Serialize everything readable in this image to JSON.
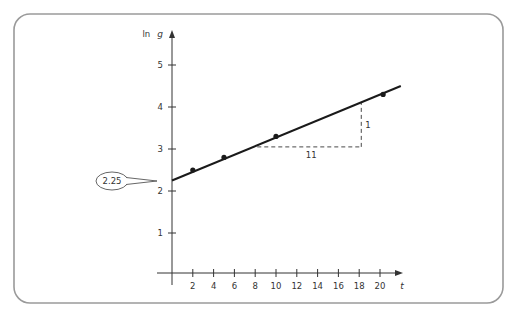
{
  "frame": {
    "stroke": "#9a9a9a",
    "background": "#ffffff"
  },
  "chart_data": {
    "type": "scatter",
    "title": "",
    "xlabel": "t",
    "ylabel": "ln g",
    "ylabel_prefix": "ln",
    "ylabel_var": "g",
    "xlim": [
      0,
      22
    ],
    "ylim": [
      0,
      5.8
    ],
    "x_ticks": [
      2,
      4,
      6,
      8,
      10,
      12,
      14,
      16,
      18,
      20
    ],
    "x_tick_labels": [
      "2",
      "4",
      "6",
      "8",
      "10",
      "12",
      "14",
      "16",
      "18",
      "20"
    ],
    "y_ticks": [
      1,
      2,
      3,
      4,
      5
    ],
    "y_tick_labels": [
      "1",
      "2",
      "3",
      "4",
      "5"
    ],
    "grid": false,
    "legend": null,
    "series": [
      {
        "name": "data points",
        "type": "scatter",
        "x": [
          2,
          5,
          10,
          20.3
        ],
        "y": [
          2.5,
          2.8,
          3.3,
          4.3
        ]
      },
      {
        "name": "fitted line",
        "type": "line",
        "x": [
          0,
          22
        ],
        "y": [
          2.25,
          4.5
        ],
        "intercept": 2.25,
        "slope": 0.0909
      }
    ],
    "annotations": [
      {
        "type": "callout",
        "text": "2.25",
        "points_to": {
          "x": 0,
          "y": 2.25
        }
      },
      {
        "type": "slope-triangle",
        "run_label": "11",
        "rise_label": "1",
        "from": {
          "x": 8.2,
          "y": 3.05
        },
        "corner": {
          "x": 18.2,
          "y": 3.05
        },
        "to": {
          "x": 18.2,
          "y": 4.1
        }
      }
    ]
  }
}
